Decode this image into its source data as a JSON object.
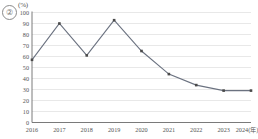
{
  "badge": {
    "label": "②"
  },
  "chart_data": {
    "type": "line",
    "title": "",
    "xlabel": "",
    "ylabel": "(%)",
    "unit_label": "(%)",
    "categories": [
      "2016",
      "2017",
      "2018",
      "2019",
      "2020",
      "2021",
      "2022",
      "2023",
      "2024(年)"
    ],
    "values": [
      57,
      90,
      61,
      93,
      65,
      44,
      34,
      29,
      29
    ],
    "ylim": [
      0,
      100
    ],
    "yticks": [
      0,
      10,
      20,
      30,
      40,
      50,
      60,
      70,
      80,
      90,
      100
    ],
    "ytick_labels": [
      "0",
      "10",
      "20",
      "30",
      "40",
      "50",
      "60",
      "70",
      "80",
      "90",
      "100"
    ],
    "grid": true,
    "legend": false,
    "series": [
      {
        "name": "series-1",
        "values": [
          57,
          90,
          61,
          93,
          65,
          44,
          34,
          29,
          29
        ],
        "marker": "square",
        "color": "#6b7280"
      }
    ],
    "colors": {
      "line": "#6b7280",
      "marker": "#4a4a4a",
      "grid": "#d9d9d9",
      "axis": "#6b6b6b",
      "text": "#555555"
    }
  }
}
